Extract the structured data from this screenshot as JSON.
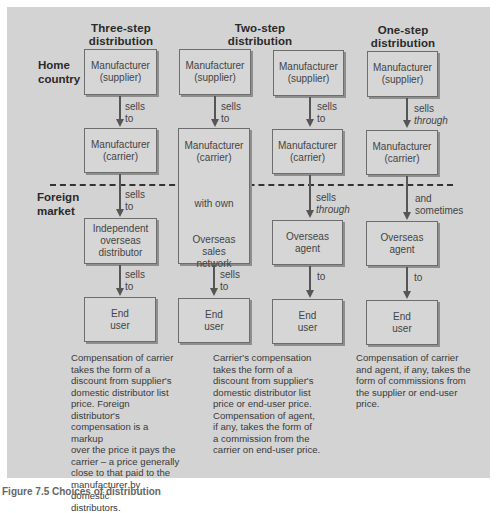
{
  "columns": [
    {
      "title_line1": "Three-step",
      "title_line2": "distribution"
    },
    {
      "title_line1": "Two-step",
      "title_line2": "distribution"
    },
    {
      "title_line1": "One-step",
      "title_line2": "distribution"
    }
  ],
  "row_labels": {
    "home": {
      "line1": "Home",
      "line2": "country"
    },
    "foreign": {
      "line1": "Foreign",
      "line2": "market"
    }
  },
  "boxes": {
    "c1_supplier": {
      "line1": "Manufacturer",
      "line2": "(supplier)"
    },
    "c1_carrier": {
      "line1": "Manufacturer",
      "line2": "(carrier)"
    },
    "c1_distributor": {
      "line1": "Independent",
      "line2": "overseas",
      "line3": "distributor"
    },
    "c1_end": {
      "line1": "End",
      "line2": "user"
    },
    "c2a_supplier": {
      "line1": "Manufacturer",
      "line2": "(supplier)"
    },
    "c2a_carrier": {
      "line1": "Manufacturer",
      "line2": "(carrier)",
      "with_own": "with own",
      "network1": "Overseas",
      "network2": "sales",
      "network3": "network"
    },
    "c2a_end": {
      "line1": "End",
      "line2": "user"
    },
    "c2b_supplier": {
      "line1": "Manufacturer",
      "line2": "(supplier)"
    },
    "c2b_carrier": {
      "line1": "Manufacturer",
      "line2": "(carrier)"
    },
    "c2b_agent": {
      "line1": "Overseas",
      "line2": "agent"
    },
    "c2b_end": {
      "line1": "End",
      "line2": "user"
    },
    "c3_supplier": {
      "line1": "Manufacturer",
      "line2": "(supplier)"
    },
    "c3_carrier": {
      "line1": "Manufacturer",
      "line2": "(carrier)"
    },
    "c3_agent": {
      "line1": "Overseas",
      "line2": "agent"
    },
    "c3_end": {
      "line1": "End",
      "line2": "user"
    }
  },
  "edges": {
    "c1_e1": {
      "line1": "sells",
      "line2": "to"
    },
    "c1_e2": {
      "line1": "sells",
      "line2": "to"
    },
    "c1_e3": {
      "line1": "sells",
      "line2": "to"
    },
    "c2a_e1": {
      "line1": "sells",
      "line2": "to"
    },
    "c2a_e2": {
      "line1": "sells",
      "line2": "to"
    },
    "c2b_e1": {
      "line1": "sells",
      "line2": "to"
    },
    "c2b_e2": {
      "line1": "sells",
      "line2": "through"
    },
    "c2b_e3": {
      "line1": "to"
    },
    "c3_e1": {
      "line1": "sells",
      "line2": "through"
    },
    "c3_e2": {
      "line1": "and",
      "line2": "sometimes"
    },
    "c3_e3": {
      "line1": "to"
    }
  },
  "captions": {
    "three_step": [
      "Compensation of carrier",
      "takes the form of a",
      "discount from supplier's",
      "domestic distributor list",
      "price. Foreign distributor's",
      "compensation is a markup",
      "over the price it pays the",
      "carrier – a price generally",
      "close to that paid to the",
      "manufacturer by domestic",
      "distributors."
    ],
    "two_step": [
      "Carrier's compensation",
      "takes the form of a",
      "discount from supplier's",
      "domestic distributor list",
      "price or end-user price.",
      "Compensation of agent,",
      "if any, takes the form of",
      "a commission from the",
      "carrier on end-user price."
    ],
    "one_step": [
      "Compensation of carrier",
      "and agent, if any, takes the",
      "form of commissions from",
      "the supplier or end-user",
      "price."
    ]
  },
  "figure_caption": "Figure 7.5  Choices of distribution"
}
